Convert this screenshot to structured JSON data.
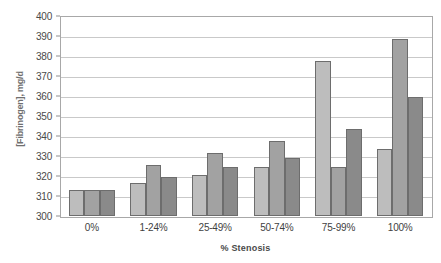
{
  "chart_data": {
    "type": "bar",
    "title": "",
    "xlabel": "% Stenosis",
    "ylabel": "[Fibrinogen], mg/d",
    "ylim": [
      300,
      400
    ],
    "ytick_step": 10,
    "yticks": [
      "400",
      "390",
      "380",
      "370",
      "360",
      "350",
      "340",
      "330",
      "320",
      "310",
      "300"
    ],
    "grid": true,
    "legend": "none",
    "categories": [
      "0%",
      "1-24%",
      "25-49%",
      "50-74%",
      "75-99%",
      "100%"
    ],
    "series": [
      {
        "name": "series-1",
        "color": "#bdbdbd",
        "values": [
          313.5,
          317,
          321,
          325,
          378,
          334
        ]
      },
      {
        "name": "series-2",
        "color": "#a2a2a2",
        "values": [
          313.5,
          326,
          332,
          338,
          325,
          389
        ]
      },
      {
        "name": "series-3",
        "color": "#8a8a8a",
        "values": [
          313.5,
          320,
          325,
          329.5,
          344,
          360
        ]
      }
    ]
  },
  "colors": {
    "series_1": "#bdbdbd",
    "series_2": "#a2a2a2",
    "series_3": "#8a8a8a",
    "gridline": "#c9c9c9",
    "axis": "#a8a8a8",
    "bar_outline": "#6d6d6d"
  }
}
